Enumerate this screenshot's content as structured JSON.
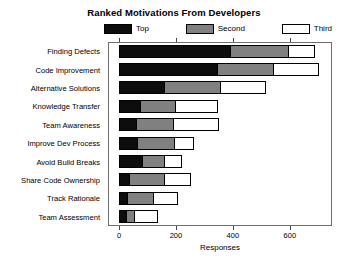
{
  "chart_data": {
    "type": "bar",
    "orientation": "horizontal",
    "stacked": true,
    "title": "Ranked Motivations From Developers",
    "xlabel": "Responses",
    "ylabel": "",
    "xlim": [
      0,
      720
    ],
    "xticks": [
      0,
      200,
      400,
      600
    ],
    "xtick_labels": [
      "0",
      "200",
      "400",
      "600"
    ],
    "grid": false,
    "legend_position": "top",
    "categories": [
      "Finding Defects",
      "Code Improvement",
      "Alternative Solutions",
      "Knowledge Transfer",
      "Team Awareness",
      "Improve Dev Process",
      "Avoid Build Breaks",
      "Share Code Ownership",
      "Track Rationale",
      "Team Assessment"
    ],
    "series": [
      {
        "name": "Top",
        "color": "#0d0d0d",
        "values": [
          385,
          342,
          153,
          70,
          56,
          59,
          77,
          31,
          24,
          21
        ]
      },
      {
        "name": "Second",
        "color": "#808080",
        "values": [
          205,
          195,
          199,
          122,
          129,
          129,
          77,
          122,
          91,
          28
        ]
      },
      {
        "name": "Third",
        "color": "#ffffff",
        "values": [
          90,
          157,
          157,
          147,
          160,
          70,
          59,
          94,
          84,
          80
        ]
      }
    ],
    "totals": [
      680,
      694,
      509,
      339,
      345,
      258,
      213,
      247,
      199,
      129
    ]
  },
  "legend": {
    "entries": [
      {
        "label": "Top",
        "color": "#0d0d0d"
      },
      {
        "label": "Second",
        "color": "#808080"
      },
      {
        "label": "Third",
        "color": "#ffffff"
      }
    ]
  }
}
